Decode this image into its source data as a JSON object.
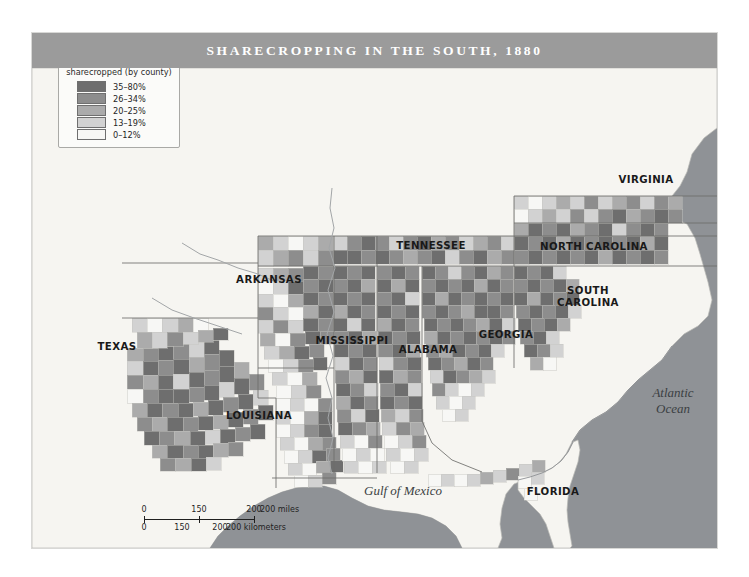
{
  "map": {
    "title": "SHARECROPPING IN THE SOUTH, 1880",
    "legend": {
      "title_line1": "Percentage of farms",
      "title_line2": "sharecropped (by county)",
      "entries": [
        {
          "label": "35–80%",
          "color": "#6e6e6e"
        },
        {
          "label": "26–34%",
          "color": "#8d8d8d"
        },
        {
          "label": "20–25%",
          "color": "#ababab"
        },
        {
          "label": "13–19%",
          "color": "#d2d2d2"
        },
        {
          "label": "0–12%",
          "color": "#f7f7f5"
        }
      ]
    },
    "state_labels": [
      {
        "name": "texas",
        "text": "TEXAS",
        "x": 85,
        "y": 314
      },
      {
        "name": "louisiana",
        "text": "LOUISIANA",
        "x": 227,
        "y": 383
      },
      {
        "name": "arkansas",
        "text": "ARKANSAS",
        "x": 237,
        "y": 247
      },
      {
        "name": "mississippi",
        "text": "MISSISSIPPI",
        "x": 320,
        "y": 308
      },
      {
        "name": "alabama",
        "text": "ALABAMA",
        "x": 396,
        "y": 317
      },
      {
        "name": "tennessee",
        "text": "TENNESSEE",
        "x": 399,
        "y": 213
      },
      {
        "name": "georgia",
        "text": "GEORGIA",
        "x": 474,
        "y": 302
      },
      {
        "name": "florida",
        "text": "FLORIDA",
        "x": 521,
        "y": 459
      },
      {
        "name": "south-carolina",
        "text": "SOUTH\nCAROLINA",
        "x": 556,
        "y": 264
      },
      {
        "name": "north-carolina",
        "text": "NORTH CAROLINA",
        "x": 562,
        "y": 214
      },
      {
        "name": "virginia",
        "text": "VIRGINIA",
        "x": 614,
        "y": 147
      }
    ],
    "water_labels": [
      {
        "name": "atlantic-ocean",
        "text": "Atlantic\nOcean",
        "x": 641,
        "y": 368
      },
      {
        "name": "gulf-of-mexico",
        "text": "Gulf of Mexico",
        "x": 371,
        "y": 458
      }
    ],
    "scalebar": {
      "miles_unit": "200 miles",
      "km_unit": "200 kilometers",
      "miles_ticks": [
        {
          "label": "0",
          "pos": 0
        },
        {
          "label": "150",
          "pos": 55
        },
        {
          "label": "200",
          "pos": 110
        }
      ],
      "km_ticks": [
        {
          "label": "0",
          "pos": 0
        },
        {
          "label": "150",
          "pos": 38
        },
        {
          "label": "200",
          "pos": 76
        }
      ]
    },
    "colors": {
      "title_band": "#9b9b9b",
      "ocean": "#8f9296",
      "land_base": "#f6f5f1",
      "page": "#ffffff",
      "border": "#8a8a87"
    }
  }
}
